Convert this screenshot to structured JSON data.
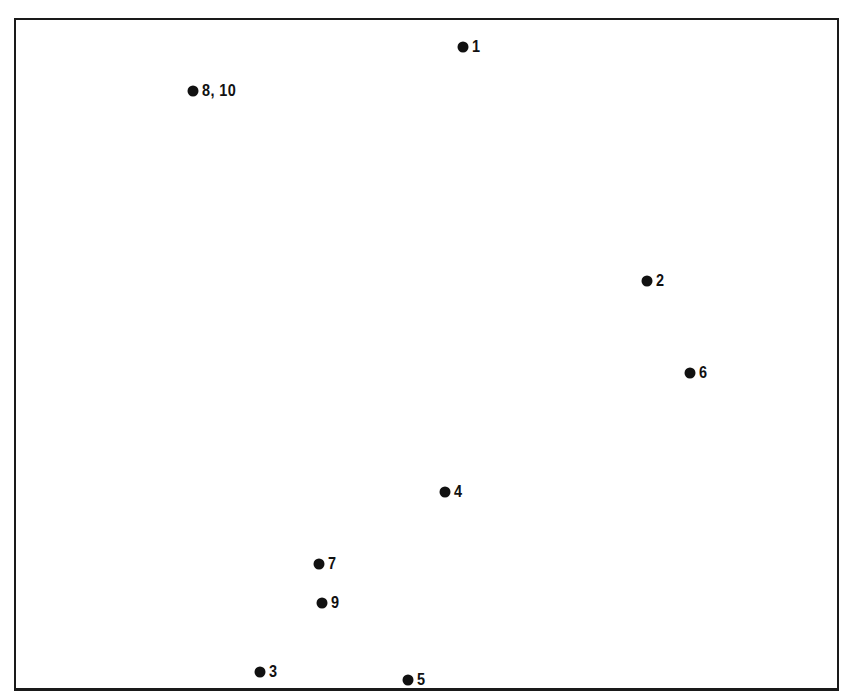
{
  "chart_data": {
    "type": "scatter",
    "title": "",
    "xlabel": "",
    "ylabel": "",
    "axes_visible": false,
    "grid": false,
    "legend": null,
    "frame": "box",
    "coordinate_note": "No axis ticks shown; values are relative positions in the plot frame (0-100, y up).",
    "points": [
      {
        "label": "1",
        "x": 54.7,
        "y": 95.7,
        "px": 463,
        "py": 47
      },
      {
        "label": "8, 10",
        "x": 21.8,
        "y": 89.1,
        "px": 193,
        "py": 91
      },
      {
        "label": "2",
        "x": 76.9,
        "y": 61.2,
        "px": 647,
        "py": 281
      },
      {
        "label": "6",
        "x": 82.1,
        "y": 47.5,
        "px": 690,
        "py": 373
      },
      {
        "label": "4",
        "x": 52.5,
        "y": 29.7,
        "px": 445,
        "py": 492
      },
      {
        "label": "7",
        "x": 37.2,
        "y": 18.9,
        "px": 319,
        "py": 564
      },
      {
        "label": "9",
        "x": 37.5,
        "y": 13.1,
        "px": 322,
        "py": 603
      },
      {
        "label": "3",
        "x": 30.0,
        "y": 2.4,
        "px": 260,
        "py": 672
      },
      {
        "label": "5",
        "x": 48.0,
        "y": 1.2,
        "px": 408,
        "py": 680
      }
    ]
  }
}
